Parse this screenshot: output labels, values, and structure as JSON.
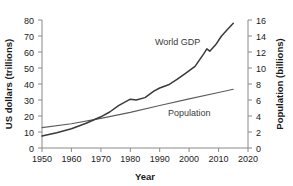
{
  "chart_data": {
    "type": "line",
    "title": "",
    "xlabel": "Year",
    "ylabel": "US dollars (trillions)",
    "y2label": "Population (billions)",
    "xlim": [
      1950,
      2020
    ],
    "ylim": [
      0,
      80
    ],
    "y2lim": [
      0,
      16
    ],
    "xticks": [
      1950,
      1960,
      1970,
      1980,
      1990,
      2000,
      2010,
      2020
    ],
    "yticks": [
      0,
      10,
      20,
      30,
      40,
      50,
      60,
      70,
      80
    ],
    "y2ticks": [
      0,
      2,
      4,
      6,
      8,
      10,
      12,
      14,
      16
    ],
    "grid": false,
    "legend_position": "inline-annotation",
    "line_color": "#3d3d3d",
    "axis_color": "#7a7a7a",
    "series": [
      {
        "name": "World GDP",
        "axis": "left",
        "units": "trillions of US dollars",
        "x": [
          1950,
          1955,
          1960,
          1965,
          1970,
          1973,
          1976,
          1980,
          1982,
          1985,
          1988,
          1990,
          1993,
          1996,
          1999,
          2002,
          2005,
          2006,
          2007,
          2008,
          2009,
          2011,
          2013,
          2015
        ],
        "values": [
          7.5,
          9.5,
          12.0,
          15.5,
          19.5,
          22.5,
          26.5,
          30.5,
          30.0,
          31.5,
          35.5,
          37.5,
          39.5,
          43.0,
          47.0,
          51.0,
          59.0,
          62.0,
          60.5,
          62.5,
          64.5,
          70.0,
          74.0,
          78.0
        ],
        "annotation": {
          "text": "World GDP",
          "x": 1993,
          "y": 66
        }
      },
      {
        "name": "Population",
        "axis": "right",
        "units": "billions",
        "x": [
          1950,
          1960,
          1970,
          1980,
          1990,
          2000,
          2010,
          2015
        ],
        "values": [
          2.55,
          3.03,
          3.7,
          4.45,
          5.32,
          6.14,
          6.93,
          7.35
        ],
        "annotation": {
          "text": "Population",
          "x": 1995,
          "y": 4.1
        }
      }
    ]
  },
  "axes": {
    "x_title": "Year",
    "y_left_title": "US dollars (trillions)",
    "y_right_title": "Population (billions)",
    "x_tick_labels": [
      "1950",
      "1960",
      "1970",
      "1980",
      "1990",
      "2000",
      "2010",
      "2020"
    ],
    "y_left_tick_labels": [
      "0",
      "10",
      "20",
      "30",
      "40",
      "50",
      "60",
      "70",
      "80"
    ],
    "y_right_tick_labels": [
      "0",
      "2",
      "4",
      "6",
      "8",
      "10",
      "12",
      "14",
      "16"
    ]
  },
  "annotations": {
    "world_gdp": "World GDP",
    "population": "Population"
  }
}
